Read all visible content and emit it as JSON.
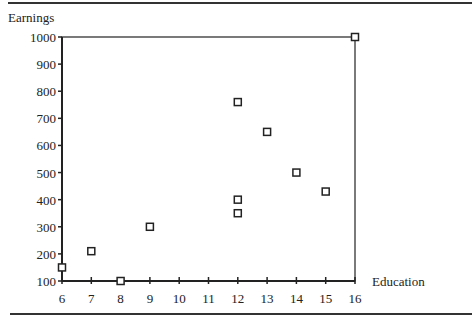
{
  "chart_data": {
    "type": "scatter",
    "title": "",
    "xlabel": "Education",
    "ylabel": "Earnings",
    "xlim": [
      6,
      16
    ],
    "ylim": [
      100,
      1000
    ],
    "x_ticks": [
      6,
      7,
      8,
      9,
      10,
      11,
      12,
      13,
      14,
      15,
      16
    ],
    "y_ticks": [
      100,
      200,
      300,
      400,
      500,
      600,
      700,
      800,
      900,
      1000
    ],
    "grid": false,
    "legend": null,
    "marker": "open-square",
    "series": [
      {
        "name": "Earnings vs Education",
        "points": [
          {
            "x": 6,
            "y": 150
          },
          {
            "x": 7,
            "y": 210
          },
          {
            "x": 8,
            "y": 100
          },
          {
            "x": 9,
            "y": 300
          },
          {
            "x": 12,
            "y": 760
          },
          {
            "x": 12,
            "y": 400
          },
          {
            "x": 12,
            "y": 350
          },
          {
            "x": 13,
            "y": 650
          },
          {
            "x": 14,
            "y": 500
          },
          {
            "x": 15,
            "y": 430
          },
          {
            "x": 16,
            "y": 1000
          }
        ]
      }
    ]
  },
  "colors": {
    "axis": "#222222",
    "marker_stroke": "#222222",
    "background": "#ffffff"
  }
}
